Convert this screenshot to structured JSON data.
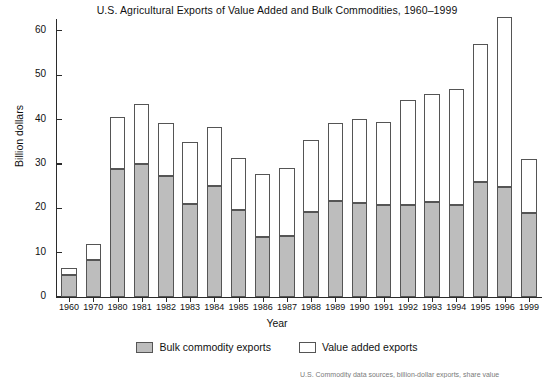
{
  "chart_data": {
    "type": "bar",
    "title": "U.S. Agricultural Exports of Value Added and Bulk Commodities, 1960–1999",
    "xlabel": "Year",
    "ylabel": "Billion dollars",
    "ylim": [
      0,
      62
    ],
    "yticks": [
      0,
      10,
      20,
      30,
      40,
      50,
      60
    ],
    "grid": false,
    "stacked": true,
    "legend_position": "bottom-center",
    "categories": [
      "1960",
      "1970",
      "1980",
      "1981",
      "1982",
      "1983",
      "1984",
      "1985",
      "1986",
      "1987",
      "1988",
      "1989",
      "1990",
      "1991",
      "1992",
      "1993",
      "1994",
      "1995",
      "1996",
      "1999"
    ],
    "series": [
      {
        "name": "Bulk commodity exports",
        "color": "#bdbdbd",
        "values": [
          5.0,
          8.3,
          28.9,
          30.0,
          27.2,
          21.0,
          25.0,
          19.6,
          13.5,
          13.7,
          19.2,
          21.6,
          21.1,
          20.7,
          20.7,
          21.4,
          20.7,
          26.0,
          24.9,
          18.9
        ]
      },
      {
        "name": "Value added exports",
        "color": "#ffffff",
        "values": [
          1.5,
          3.7,
          11.6,
          13.6,
          12.0,
          14.0,
          13.4,
          11.8,
          14.2,
          15.3,
          16.2,
          17.6,
          19.1,
          18.8,
          23.8,
          24.3,
          26.2,
          31.0,
          38.3,
          12.2
        ]
      }
    ],
    "totals": [
      6.5,
      12.0,
      40.5,
      43.6,
      39.2,
      35.0,
      38.4,
      31.4,
      27.7,
      29.0,
      35.4,
      39.2,
      40.2,
      39.5,
      44.5,
      45.7,
      46.9,
      57.0,
      63.2,
      31.1
    ]
  },
  "legend": {
    "items": [
      {
        "label": "Bulk commodity exports",
        "swatch": "filled-gray-swatch"
      },
      {
        "label": "Value added exports",
        "swatch": "outlined-white-swatch"
      }
    ]
  },
  "source_note": "U.S. Commodity data sources, billion-dollar exports, share value"
}
